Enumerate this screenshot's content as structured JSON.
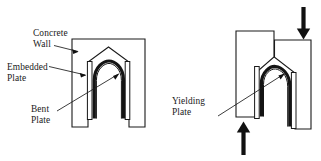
{
  "figure": {
    "background_color": "#ffffff",
    "line_color": "#1a1a1a",
    "plate_color": "#141414",
    "width_px": 321,
    "height_px": 161
  },
  "labels": {
    "concrete_wall": "Concrete\nWall",
    "embedded_plate": "Embedded\nPlate",
    "bent_plate": "Bent\nPlate",
    "yielding_plate": "Yielding\nPlate"
  },
  "panels": [
    {
      "id": "undeformed",
      "name": "undeformed-assembly",
      "state": "undeformed",
      "callouts": [
        "concrete_wall",
        "embedded_plate",
        "bent_plate"
      ],
      "load_arrows": []
    },
    {
      "id": "deformed",
      "name": "deformed-assembly",
      "state": "deformed-under-shear",
      "callouts": [
        "yielding_plate"
      ],
      "load_arrows": [
        {
          "name": "downward-load-arrow",
          "direction": "down",
          "position": "top-right"
        },
        {
          "name": "upward-load-arrow",
          "direction": "up",
          "position": "bottom-left"
        }
      ]
    }
  ],
  "components": [
    {
      "name": "concrete-wall",
      "count": 4,
      "description": "wall panels forming the vertical joint"
    },
    {
      "name": "embedded-plate",
      "count": 4,
      "description": "plates cast into the wall faces"
    },
    {
      "name": "bent-plate",
      "count": 2,
      "description": "U-shaped steel bent plate damper"
    }
  ]
}
